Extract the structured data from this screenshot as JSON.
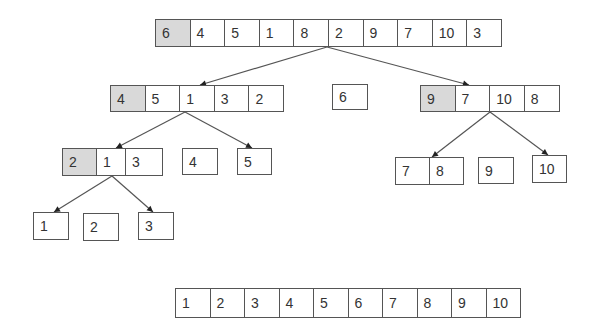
{
  "colors": {
    "pivot_fill": "#d9d9d9",
    "border": "#555555",
    "text": "#333333",
    "arrow": "#555555"
  },
  "arrays": [
    {
      "id": "root",
      "level": 0,
      "x": 155,
      "y": 19,
      "h": 28,
      "cellw": 34.6,
      "values": [
        "6",
        "4",
        "5",
        "1",
        "8",
        "2",
        "9",
        "7",
        "10",
        "3"
      ],
      "pivot_index": 0
    },
    {
      "id": "left",
      "level": 1,
      "x": 110,
      "y": 85,
      "h": 27,
      "cellw": 34.6,
      "values": [
        "4",
        "5",
        "1",
        "3",
        "2"
      ],
      "pivot_index": 0
    },
    {
      "id": "pivot-6",
      "level": 1,
      "x": 332,
      "y": 84,
      "h": 26,
      "cellw": 35,
      "values": [
        "6"
      ],
      "pivot_index": -1
    },
    {
      "id": "right",
      "level": 1,
      "x": 420,
      "y": 85,
      "h": 27,
      "cellw": 34.6,
      "values": [
        "9",
        "7",
        "10",
        "8"
      ],
      "pivot_index": 0
    },
    {
      "id": "left-left",
      "level": 2,
      "x": 62,
      "y": 148,
      "h": 28,
      "widths": [
        34,
        29,
        37
      ],
      "values": [
        "2",
        "1",
        "3"
      ],
      "pivot_index": 0
    },
    {
      "id": "pivot-4",
      "level": 2,
      "x": 182,
      "y": 148,
      "h": 27,
      "cellw": 35,
      "values": [
        "4"
      ],
      "pivot_index": -1
    },
    {
      "id": "left-right",
      "level": 2,
      "x": 237,
      "y": 148,
      "h": 27,
      "cellw": 34,
      "values": [
        "5"
      ],
      "pivot_index": -1
    },
    {
      "id": "right-left",
      "level": 2,
      "x": 395,
      "y": 157,
      "h": 28,
      "widths": [
        34,
        34
      ],
      "values": [
        "7",
        "8"
      ],
      "pivot_index": -1
    },
    {
      "id": "pivot-9",
      "level": 2,
      "x": 478,
      "y": 157,
      "h": 27,
      "cellw": 35,
      "values": [
        "9"
      ],
      "pivot_index": -1
    },
    {
      "id": "right-right",
      "level": 2,
      "x": 532,
      "y": 155,
      "h": 28,
      "cellw": 34,
      "values": [
        "10"
      ],
      "pivot_index": -1
    },
    {
      "id": "ll-left",
      "level": 3,
      "x": 33,
      "y": 212,
      "h": 28,
      "cellw": 35,
      "values": [
        "1"
      ],
      "pivot_index": -1
    },
    {
      "id": "pivot-2",
      "level": 3,
      "x": 83,
      "y": 213,
      "h": 28,
      "cellw": 35,
      "values": [
        "2"
      ],
      "pivot_index": -1
    },
    {
      "id": "ll-right",
      "level": 3,
      "x": 138,
      "y": 212,
      "h": 28,
      "cellw": 35,
      "values": [
        "3"
      ],
      "pivot_index": -1
    },
    {
      "id": "sorted",
      "level": 4,
      "x": 175,
      "y": 288,
      "h": 30,
      "cellw": 34.5,
      "values": [
        "1",
        "2",
        "3",
        "4",
        "5",
        "6",
        "7",
        "8",
        "9",
        "10"
      ],
      "pivot_index": -1
    }
  ],
  "arrows": [
    {
      "from": [
        327,
        47
      ],
      "to": [
        200,
        85
      ]
    },
    {
      "from": [
        327,
        47
      ],
      "to": [
        469,
        85
      ]
    },
    {
      "from": [
        185,
        112
      ],
      "to": [
        116,
        148
      ]
    },
    {
      "from": [
        185,
        112
      ],
      "to": [
        252,
        148
      ]
    },
    {
      "from": [
        490,
        112
      ],
      "to": [
        432,
        157
      ]
    },
    {
      "from": [
        490,
        112
      ],
      "to": [
        548,
        155
      ]
    },
    {
      "from": [
        112,
        176
      ],
      "to": [
        54,
        212
      ]
    },
    {
      "from": [
        112,
        176
      ],
      "to": [
        153,
        212
      ]
    }
  ]
}
